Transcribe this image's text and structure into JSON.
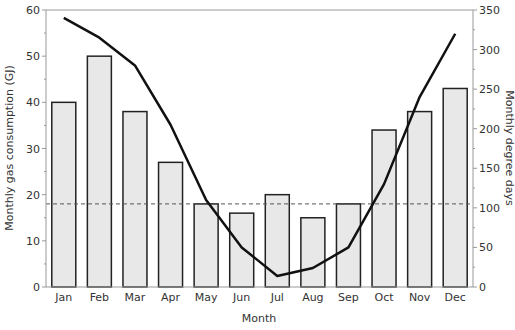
{
  "chart_data": {
    "type": "bar+line",
    "title": "",
    "xlabel": "Month",
    "ylabel": "Monthly gas consumption (GJ)",
    "y2label": "Monthly degree days",
    "categories": [
      "Jan",
      "Feb",
      "Mar",
      "Apr",
      "May",
      "Jun",
      "Jul",
      "Aug",
      "Sep",
      "Oct",
      "Nov",
      "Dec"
    ],
    "series": [
      {
        "name": "Monthly gas consumption (GJ)",
        "type": "bar",
        "axis": "left",
        "values": [
          40,
          50,
          38,
          27,
          18,
          16,
          20,
          15,
          18,
          34,
          38,
          43
        ]
      },
      {
        "name": "Monthly degree days",
        "type": "line",
        "axis": "right",
        "values": [
          340,
          315,
          280,
          205,
          110,
          50,
          14,
          24,
          50,
          130,
          240,
          320
        ]
      }
    ],
    "reference_line": {
      "type": "dashed",
      "value_left": 18,
      "value_right": 108
    },
    "ylim": [
      0,
      60
    ],
    "y2lim": [
      0,
      350
    ],
    "yticks": [
      0,
      10,
      20,
      30,
      40,
      50,
      60
    ],
    "y2ticks": [
      0,
      50,
      100,
      150,
      200,
      250,
      300,
      350
    ],
    "grid": false,
    "legend": "none",
    "colors": {
      "bar_fill": "#e8e8e8",
      "bar_stroke": "#222222",
      "line": "#111111",
      "axis": "#999999"
    }
  }
}
